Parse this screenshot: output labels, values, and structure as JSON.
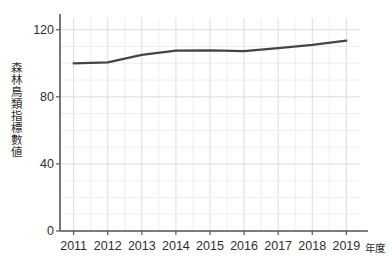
{
  "chart_data": {
    "type": "line",
    "title": "",
    "subtitle": "",
    "xlabel": "年度",
    "ylabel": "森林鳥類指標數値",
    "categories": [
      "2011",
      "2012",
      "2013",
      "2014",
      "2015",
      "2016",
      "2017",
      "2018",
      "2019"
    ],
    "x": [
      2011,
      2012,
      2013,
      2014,
      2015,
      2016,
      2017,
      2018,
      2019
    ],
    "values": [
      100.0,
      100.5,
      105.0,
      107.5,
      107.7,
      107.3,
      109.0,
      111.0,
      113.5
    ],
    "series": [
      {
        "name": "森林鳥類指標數値",
        "values": [
          100.0,
          100.5,
          105.0,
          107.5,
          107.7,
          107.3,
          109.0,
          111.0,
          113.5
        ],
        "color": "#444444"
      }
    ],
    "ylim": [
      0,
      127
    ],
    "xlim": [
      2010.6,
      2019.4
    ],
    "y_ticks_major": [
      0,
      40,
      80,
      120
    ],
    "y_tick_labels": [
      "0",
      "40",
      "80",
      "120"
    ],
    "y_minor_step": 10,
    "x_ticks": [
      2011,
      2012,
      2013,
      2014,
      2015,
      2016,
      2017,
      2018,
      2019
    ],
    "x_minor_step": 0.5,
    "grid": true,
    "grid_color": "#d8d8dc",
    "minor_grid_color": "#e8e8ec",
    "axis_color": "#555555",
    "legend": null,
    "legend_position": "none",
    "background": "#ffffff",
    "line_width": 2.2,
    "markers": false
  },
  "axis": {
    "y_title": "森林鳥類指標數値",
    "x_title": "年度",
    "y_labels": [
      "120",
      "80",
      "40",
      "0"
    ],
    "x_labels": [
      "2011",
      "2012",
      "2013",
      "2014",
      "2015",
      "2016",
      "2017",
      "2018",
      "2019"
    ]
  }
}
